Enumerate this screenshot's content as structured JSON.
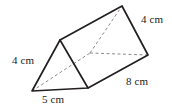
{
  "figure": {
    "name": "triangular-prism-diagram",
    "shape": "triangular prism",
    "units": "cm",
    "stroke_color": "#231f20",
    "hidden_stroke_color": "#8c8c8c",
    "background_color": "#ffffff",
    "labels": {
      "left_slant": "4 cm",
      "bottom_base": "5 cm",
      "right_slant": "4 cm",
      "length": "8 cm"
    },
    "vertices": {
      "front_bottom_left": {
        "x": 32,
        "y": 91
      },
      "front_apex": {
        "x": 60,
        "y": 40
      },
      "front_bottom_right": {
        "x": 88,
        "y": 88
      },
      "back_bottom_left": {
        "x": 90,
        "y": 53
      },
      "back_apex": {
        "x": 122,
        "y": 6
      },
      "back_bottom_right": {
        "x": 148,
        "y": 55
      }
    },
    "edges": [
      {
        "name": "front-triangle-left-edge",
        "from": "front_bottom_left",
        "to": "front_apex",
        "hidden": false
      },
      {
        "name": "front-triangle-right-edge",
        "from": "front_apex",
        "to": "front_bottom_right",
        "hidden": false
      },
      {
        "name": "front-triangle-base-edge",
        "from": "front_bottom_left",
        "to": "front_bottom_right",
        "hidden": false
      },
      {
        "name": "top-ridge-edge",
        "from": "front_apex",
        "to": "back_apex",
        "hidden": false
      },
      {
        "name": "back-triangle-right-edge",
        "from": "back_apex",
        "to": "back_bottom_right",
        "hidden": false
      },
      {
        "name": "bottom-right-long-edge",
        "from": "front_bottom_right",
        "to": "back_bottom_right",
        "hidden": false
      },
      {
        "name": "hidden-back-left-edge",
        "from": "back_bottom_left",
        "to": "back_apex",
        "hidden": true
      },
      {
        "name": "hidden-back-base-edge",
        "from": "back_bottom_left",
        "to": "back_bottom_right",
        "hidden": true
      },
      {
        "name": "hidden-bottom-left-edge",
        "from": "front_bottom_left",
        "to": "back_bottom_left",
        "hidden": true
      }
    ]
  }
}
